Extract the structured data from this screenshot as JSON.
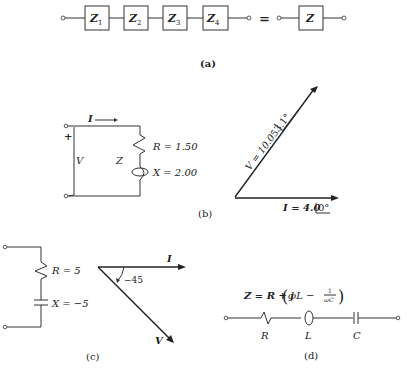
{
  "panel_a": {
    "caption": "(a)",
    "blocks": [
      {
        "label": "Z",
        "sub": "1"
      },
      {
        "label": "Z",
        "sub": "2"
      },
      {
        "label": "Z",
        "sub": "3"
      },
      {
        "label": "Z",
        "sub": "4"
      }
    ],
    "equals": "=",
    "equivalent": {
      "label": "Z"
    }
  },
  "panel_b": {
    "caption": "(b)",
    "circuit": {
      "current_label": "I",
      "plus_sign": "+",
      "voltage_label": "V",
      "impedance_label": "Z",
      "resistor_label": "R = 1.50",
      "reactance_label": "X = 2.00"
    },
    "phasor": {
      "voltage_label": "V = 10.0",
      "voltage_angle": "53.1°",
      "current_label": "I = 4.0",
      "current_angle": "0°"
    }
  },
  "panel_c": {
    "caption": "(c)",
    "circuit": {
      "resistor_label": "R = 5",
      "reactance_label": "X = −5"
    },
    "phasor": {
      "current_label": "I",
      "voltage_label": "V",
      "angle_label": "−45"
    }
  },
  "panel_d": {
    "caption": "(d)",
    "equation": {
      "lhs": "Z = R + j",
      "inner": "ωL −",
      "frac_num": "1",
      "frac_den": "ωC"
    },
    "component_labels": [
      "R",
      "L",
      "C"
    ]
  }
}
